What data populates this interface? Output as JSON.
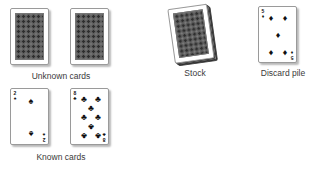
{
  "groups": {
    "unknown": {
      "label": "Unknown cards",
      "cards": [
        {
          "face": "down"
        },
        {
          "face": "down"
        }
      ]
    },
    "stock": {
      "label": "Stock",
      "face": "down"
    },
    "discard": {
      "label": "Discard pile",
      "card": {
        "rank": "5",
        "suit": "diamonds",
        "suit_symbol": "♦"
      }
    },
    "known": {
      "label": "Known cards",
      "cards": [
        {
          "rank": "2",
          "suit": "spades",
          "suit_symbol": "♠"
        },
        {
          "rank": "8",
          "suit": "clubs",
          "suit_symbol": "♣"
        }
      ]
    }
  },
  "colors": {
    "background": "#ffffff",
    "card_back": "#5e5e5e",
    "label_text": "#3a3a3a",
    "pip": "#111111"
  }
}
